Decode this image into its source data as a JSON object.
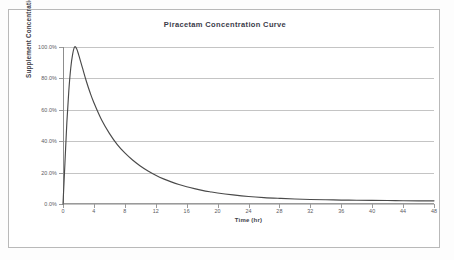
{
  "chart_data": {
    "type": "line",
    "title": "Piracetam Concentration Curve",
    "xlabel": "Time (hr)",
    "ylabel": "Supplement Concentration",
    "xlim": [
      0,
      48
    ],
    "ylim": [
      0,
      100
    ],
    "grid": true,
    "legend": "none",
    "x_ticks": [
      "0",
      "4",
      "8",
      "12",
      "16",
      "20",
      "24",
      "28",
      "32",
      "36",
      "40",
      "44",
      "48"
    ],
    "x_tick_values": [
      0,
      4,
      8,
      12,
      16,
      20,
      24,
      28,
      32,
      36,
      40,
      44,
      48
    ],
    "y_ticks": [
      "0.0%",
      "20.0%",
      "40.0%",
      "60.0%",
      "80.0%",
      "100.0%"
    ],
    "y_tick_values": [
      0,
      20,
      40,
      60,
      80,
      100
    ],
    "series": [
      {
        "name": "Piracetam concentration",
        "color": "#4a4a4a",
        "x": [
          0,
          0.25,
          0.5,
          0.75,
          1,
          1.25,
          1.5,
          1.75,
          2,
          2.5,
          3,
          3.5,
          4,
          5,
          6,
          7,
          8,
          9,
          10,
          11,
          12,
          13,
          14,
          15,
          16,
          17,
          18,
          19,
          20,
          22,
          24,
          26,
          28,
          30,
          32,
          34,
          36,
          38,
          40,
          42,
          44,
          46,
          48
        ],
        "values": [
          0.0,
          26.0,
          52.0,
          72.0,
          86.5,
          95.5,
          100.0,
          99.0,
          95.5,
          87.0,
          78.5,
          71.0,
          64.5,
          53.5,
          45.0,
          38.0,
          32.5,
          28.0,
          24.2,
          21.0,
          18.3,
          16.0,
          14.1,
          12.4,
          11.0,
          9.8,
          8.7,
          7.8,
          7.0,
          5.8,
          4.8,
          4.1,
          3.6,
          3.2,
          2.9,
          2.7,
          2.5,
          2.4,
          2.3,
          2.2,
          2.1,
          2.0,
          2.0
        ]
      }
    ],
    "peak": {
      "time_hr": 1.5,
      "concentration": "100.0%"
    }
  },
  "chart": {
    "title": "Piracetam Concentration Curve",
    "x_axis_title": "Time (hr)",
    "y_axis_title": "Supplement Concentration"
  },
  "colors": {
    "curve": "#4a4a4a",
    "gridline": "#c4c4c4",
    "axis": "#9a9a9a",
    "frame": "#b9b9b9",
    "title_text": "#3a3a48",
    "tick_text": "#5a5a60",
    "plot_background": "#ffffff"
  }
}
